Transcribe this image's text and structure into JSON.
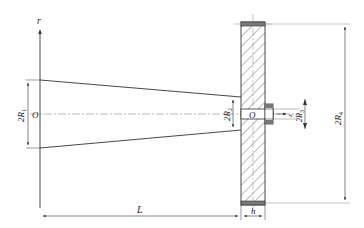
{
  "diagram": {
    "type": "engineering-drawing",
    "colors": {
      "line": "#333333",
      "hatch": "#555555",
      "centerline": "#888888",
      "background": "#ffffff"
    },
    "labels": {
      "axis_r": "r",
      "origin_left": "O",
      "origin_right": "O",
      "dim_R1": "2R",
      "dim_R1_sub": "1",
      "dim_R2": "2R",
      "dim_R2_sub": "2",
      "dim_R3": "2R",
      "dim_R3_sub": "3",
      "dim_R4": "2R",
      "dim_R4_sub": "4",
      "axis_z": "z",
      "dim_L": "L",
      "dim_h": "h"
    }
  }
}
